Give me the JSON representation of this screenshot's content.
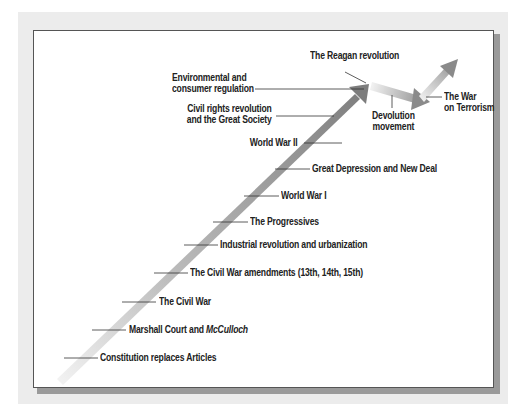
{
  "diagram": {
    "type": "timeline-arrow",
    "colors": {
      "panel_bg": "#ececec",
      "box_bg": "#ffffff",
      "box_border": "#555555",
      "shadow": "#9a9a9a",
      "arrow_light": "#e6e6e6",
      "arrow_dark": "#808080",
      "leader_line": "#333333",
      "text": "#222222"
    },
    "labels": {
      "constitution": "Constitution replaces Articles",
      "marshall_prefix": "Marshall Court and ",
      "marshall_italic": "McCulloch",
      "civil_war": "The Civil War",
      "civil_war_amendments": "The Civil War amendments (13th, 14th, 15th)",
      "industrial": "Industrial revolution and urbanization",
      "progressives": "The Progressives",
      "ww1": "World War I",
      "depression": "Great Depression and New Deal",
      "ww2": "World War II",
      "civil_rights_line1": "Civil rights revolution",
      "civil_rights_line2": "and the Great Society",
      "environmental_line1": "Environmental and",
      "environmental_line2": "consumer regulation",
      "reagan": "The Reagan revolution",
      "devolution_line1": "Devolution",
      "devolution_line2": "movement",
      "terrorism_line1": "The War",
      "terrorism_line2": "on Terrorism"
    }
  }
}
